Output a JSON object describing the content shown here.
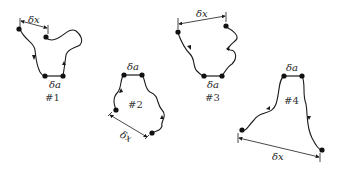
{
  "figure": {
    "loops": [
      {
        "id": "loop-1",
        "number_label": "#1",
        "a_label": "δa",
        "x_label": "δx"
      },
      {
        "id": "loop-2",
        "number_label": "#2",
        "a_label": "δa",
        "x_label": "δx"
      },
      {
        "id": "loop-3",
        "number_label": "#3",
        "a_label": "δa",
        "x_label": "δx"
      },
      {
        "id": "loop-4",
        "number_label": "#4",
        "a_label": "δa",
        "x_label": "δx"
      }
    ]
  }
}
